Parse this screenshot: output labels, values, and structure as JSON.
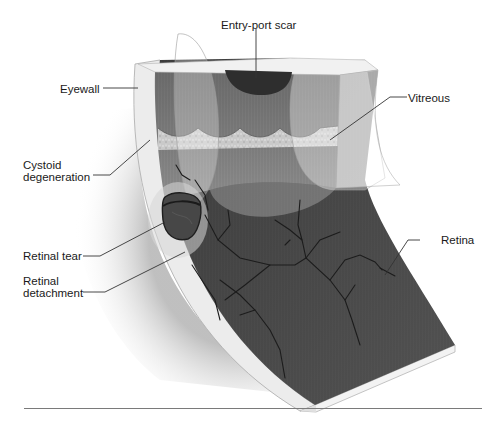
{
  "figure": {
    "type": "anatomical-illustration",
    "colors": {
      "retina": "#4a4a4a",
      "vessel": "#1e1e1e",
      "eyewall": "#ebebeb",
      "vitreous": "#8a8a8a",
      "cystoid_band": "#cfcfcf",
      "shadow": "#c8c8c8",
      "leader": "#333333",
      "rule": "#7a7a7a"
    }
  },
  "labels": {
    "entry_port_scar": "Entry-port scar",
    "eyewall": "Eyewall",
    "vitreous": "Vitreous",
    "cystoid_degeneration": "Cystoid\ndegeneration",
    "retinal_tear": "Retinal tear",
    "retina": "Retina",
    "retinal_detachment": "Retinal\ndetachment"
  }
}
